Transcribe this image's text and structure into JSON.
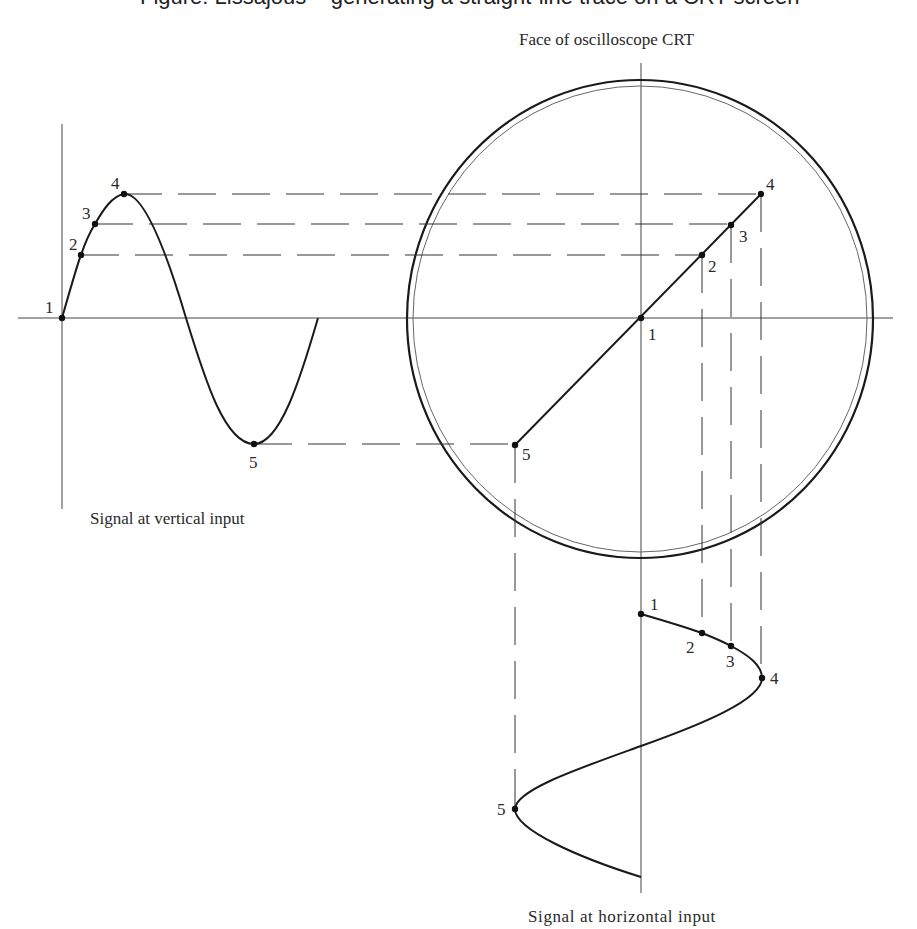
{
  "figure": {
    "top_caption_fragment": "Figure: Lissajous – generating a straight-line trace on a CRT screen",
    "crt_title": "Face of oscilloscope    CRT",
    "vertical_input_caption": "Signal at vertical input",
    "horizontal_input_caption": "Signal at horizontal input"
  },
  "vertical_signal": {
    "points": [
      {
        "label": "1",
        "x": 62,
        "y": 318
      },
      {
        "label": "2",
        "x": 81,
        "y": 255
      },
      {
        "label": "3",
        "x": 95,
        "y": 224
      },
      {
        "label": "4",
        "x": 124,
        "y": 194
      },
      {
        "label": "5",
        "x": 254,
        "y": 444
      }
    ]
  },
  "crt_trace": {
    "points": [
      {
        "label": "1",
        "x": 641,
        "y": 318
      },
      {
        "label": "2",
        "x": 702,
        "y": 255
      },
      {
        "label": "3",
        "x": 731,
        "y": 225
      },
      {
        "label": "4",
        "x": 761,
        "y": 194
      },
      {
        "label": "5",
        "x": 515,
        "y": 445
      }
    ]
  },
  "horizontal_signal": {
    "points": [
      {
        "label": "1",
        "x": 641,
        "y": 614
      },
      {
        "label": "2",
        "x": 702,
        "y": 633
      },
      {
        "label": "3",
        "x": 731,
        "y": 646
      },
      {
        "label": "4",
        "x": 762,
        "y": 678
      },
      {
        "label": "5",
        "x": 515,
        "y": 809
      }
    ]
  },
  "colors": {
    "ink": "#1a1a1a",
    "background": "#ffffff"
  }
}
